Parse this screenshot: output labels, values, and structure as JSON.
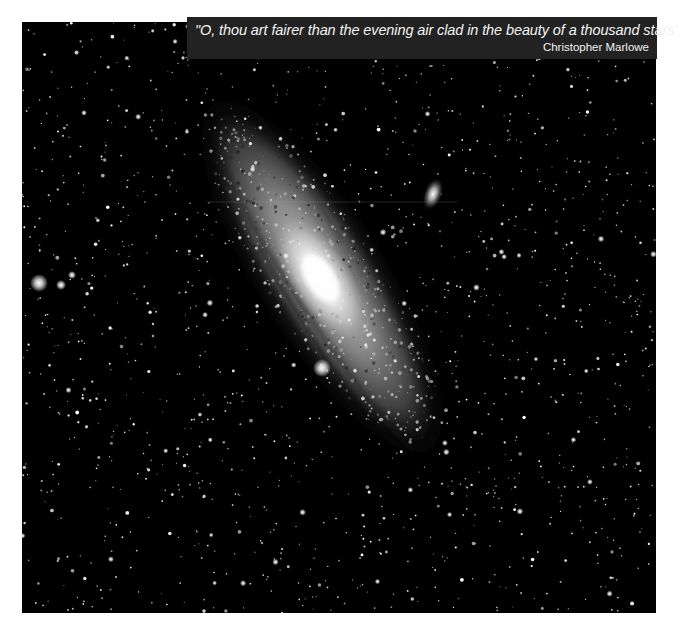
{
  "image": {
    "subject": "Andromeda galaxy star field",
    "colors": {
      "page_background": "#ffffff",
      "sky": "#000000",
      "banner_background": "#222222",
      "banner_text": "#f2f2f2"
    }
  },
  "quote": {
    "text": "\"O, thou art fairer than the evening air clad in the beauty of a thousand stars\"",
    "author": "Christopher Marlowe"
  }
}
